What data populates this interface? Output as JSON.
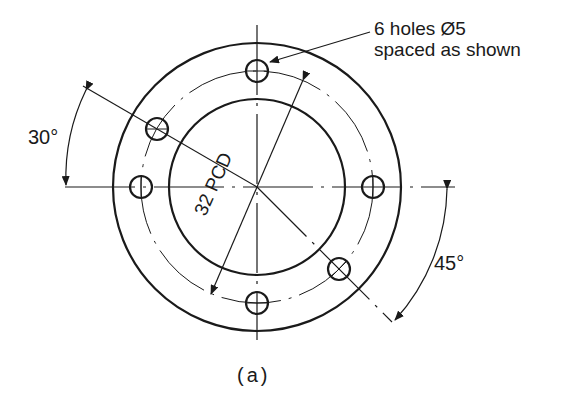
{
  "figure": {
    "caption": "(a)",
    "callout_line1": "6 holes Ø5",
    "callout_line2": "spaced as shown",
    "pcd_label": "32 PCD",
    "angle_top_left": "30°",
    "angle_bottom_right": "45°"
  },
  "geometry": {
    "center": [
      257,
      187
    ],
    "outer_radius": 144,
    "pcd_radius": 116,
    "inner_radius": 88,
    "hole_radius": 11,
    "hole_angles_deg": [
      90,
      150,
      180,
      270,
      315,
      0
    ]
  },
  "colors": {
    "ink": "#1a1a1a",
    "background": "#ffffff"
  }
}
